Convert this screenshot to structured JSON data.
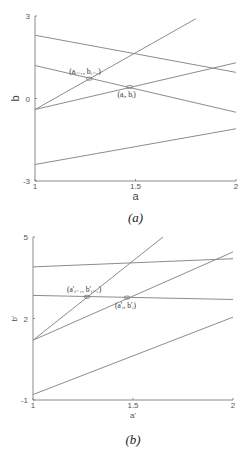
{
  "chart_data": [
    {
      "type": "line",
      "panel": "a",
      "caption": "(a)",
      "xlabel": "a",
      "ylabel": "b",
      "xlim": [
        1,
        2
      ],
      "ylim": [
        -3,
        3
      ],
      "xticks": [
        "1",
        "1.5",
        "2"
      ],
      "yticks": [
        "3",
        "0",
        "-3"
      ],
      "grid": false,
      "series": [
        {
          "name": "line-1",
          "x": [
            1,
            2
          ],
          "y": [
            2.3,
            0.95
          ]
        },
        {
          "name": "line-2",
          "x": [
            1,
            2
          ],
          "y": [
            1.2,
            -0.5
          ]
        },
        {
          "name": "line-3",
          "x": [
            1,
            1.8
          ],
          "y": [
            -0.4,
            2.9
          ]
        },
        {
          "name": "line-4",
          "x": [
            1,
            2
          ],
          "y": [
            -0.4,
            1.3
          ]
        },
        {
          "name": "line-5",
          "x": [
            1,
            2
          ],
          "y": [
            -2.4,
            -1.1
          ]
        }
      ],
      "annotations": [
        {
          "label": "(aᵢ₋₁, bᵢ₋₁)",
          "x": 1.27,
          "y": 0.72
        },
        {
          "label": "(aᵢ, bᵢ)",
          "x": 1.47,
          "y": 0.42
        }
      ]
    },
    {
      "type": "line",
      "panel": "b",
      "caption": "(b)",
      "xlabel": "a'",
      "ylabel": "b'",
      "xlim": [
        1,
        2
      ],
      "ylim": [
        -1,
        5
      ],
      "xticks": [
        "1",
        "1.5",
        "2"
      ],
      "yticks": [
        "5",
        "2",
        "-1"
      ],
      "grid": false,
      "series": [
        {
          "name": "line-1",
          "x": [
            1,
            1.65
          ],
          "y": [
            1.2,
            5.0
          ]
        },
        {
          "name": "line-2",
          "x": [
            1,
            2
          ],
          "y": [
            1.2,
            4.45
          ]
        },
        {
          "name": "line-3",
          "x": [
            1,
            2
          ],
          "y": [
            3.9,
            4.2
          ]
        },
        {
          "name": "line-4",
          "x": [
            1,
            2
          ],
          "y": [
            2.85,
            2.7
          ]
        },
        {
          "name": "line-5",
          "x": [
            1,
            2
          ],
          "y": [
            -0.8,
            2.05
          ]
        }
      ],
      "annotations": [
        {
          "label": "(a'ᵢ₋₁, b'ᵢ₋₁)",
          "x": 1.27,
          "y": 2.8
        },
        {
          "label": "(a'ᵢ, b'ᵢ)",
          "x": 1.47,
          "y": 2.77
        }
      ]
    }
  ],
  "layout": [
    {
      "x0": 35,
      "x1": 236,
      "yTop": 16,
      "yBot": 181,
      "tickY": 189,
      "xlabelY": 200,
      "captionY": 222,
      "ylabelX": 19,
      "tickLabelX": 30
    },
    {
      "x0": 33,
      "x1": 233,
      "yTop": 237,
      "yBot": 400,
      "tickY": 408,
      "xlabelY": 418,
      "captionY": 444,
      "ylabelX": 17,
      "tickLabelX": 28
    }
  ]
}
